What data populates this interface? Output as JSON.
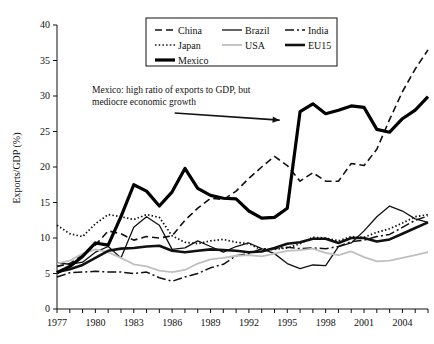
{
  "chart_data": {
    "type": "line",
    "title": "",
    "xlabel": "",
    "ylabel": "Exports/GDP (%)",
    "xlim": [
      1977,
      2006
    ],
    "ylim": [
      0,
      40
    ],
    "ytick_step": 5,
    "yticks": [
      0,
      5,
      10,
      15,
      20,
      25,
      30,
      35,
      40
    ],
    "ytick_labels": [
      "0",
      "5",
      "10",
      "15",
      "20",
      "25",
      "30",
      "35",
      "40"
    ],
    "xticks": [
      1977,
      1978,
      1979,
      1980,
      1981,
      1982,
      1983,
      1984,
      1985,
      1986,
      1987,
      1988,
      1989,
      1990,
      1991,
      1992,
      1993,
      1994,
      1995,
      1996,
      1997,
      1998,
      1999,
      2000,
      2001,
      2002,
      2003,
      2004,
      2005,
      2006
    ],
    "xtick_labels_shown": [
      "1977",
      "1980",
      "1983",
      "1986",
      "1989",
      "1992",
      "1995",
      "1998",
      "2001",
      "2004"
    ],
    "xtick_label_years": [
      1977,
      1980,
      1983,
      1986,
      1989,
      1992,
      1995,
      1998,
      2001,
      2004
    ],
    "grid": false,
    "legend_position": "top-center",
    "x": [
      1977,
      1978,
      1979,
      1980,
      1981,
      1982,
      1983,
      1984,
      1985,
      1986,
      1987,
      1988,
      1989,
      1990,
      1991,
      1992,
      1993,
      1994,
      1995,
      1996,
      1997,
      1998,
      1999,
      2000,
      2001,
      2002,
      2003,
      2004,
      2005,
      2006
    ],
    "series": [
      {
        "name": "China",
        "style": "dashed",
        "color": "#111111",
        "width": 1.6,
        "dash": "7,4",
        "values": [
          6.0,
          6.4,
          7.6,
          9.0,
          11.0,
          10.6,
          9.7,
          10.2,
          10.0,
          10.3,
          12.5,
          14.2,
          15.6,
          15.4,
          16.6,
          18.4,
          20.0,
          21.5,
          20.2,
          18.0,
          19.2,
          18.0,
          18.0,
          20.5,
          20.2,
          22.5,
          26.7,
          30.6,
          33.8,
          36.5
        ]
      },
      {
        "name": "Brazil",
        "style": "solid",
        "color": "#111111",
        "width": 1.3,
        "dash": "none",
        "values": [
          6.5,
          6.3,
          6.6,
          8.0,
          8.8,
          7.2,
          11.5,
          13.0,
          11.8,
          8.4,
          8.6,
          9.6,
          8.8,
          8.0,
          8.8,
          9.3,
          8.5,
          7.8,
          6.4,
          5.7,
          6.2,
          6.1,
          8.8,
          9.3,
          11.0,
          13.0,
          14.5,
          13.8,
          12.7,
          12.2
        ]
      },
      {
        "name": "India",
        "style": "dash-dot",
        "color": "#111111",
        "width": 1.5,
        "dash": "9,3,2,3",
        "values": [
          4.5,
          5.1,
          5.2,
          5.3,
          5.2,
          5.2,
          5.0,
          5.2,
          4.4,
          3.9,
          4.5,
          5.0,
          5.8,
          6.3,
          7.5,
          7.8,
          8.5,
          8.5,
          8.7,
          8.5,
          8.6,
          8.5,
          8.8,
          9.5,
          9.7,
          10.2,
          10.5,
          11.5,
          12.5,
          13.1
        ]
      },
      {
        "name": "Japan",
        "style": "dotted",
        "color": "#111111",
        "width": 1.7,
        "dash": "1.5,2.2",
        "values": [
          11.8,
          10.6,
          10.2,
          12.0,
          13.3,
          13.0,
          12.6,
          13.3,
          12.9,
          10.3,
          9.4,
          9.2,
          9.6,
          9.8,
          9.4,
          9.2,
          8.3,
          8.4,
          8.6,
          9.2,
          10.1,
          10.0,
          9.6,
          10.2,
          10.1,
          10.8,
          11.3,
          12.1,
          13.0,
          13.3
        ]
      },
      {
        "name": "USA",
        "style": "solid",
        "color": "#bfbfbf",
        "width": 1.8,
        "dash": "none",
        "values": [
          6.4,
          6.8,
          7.8,
          8.4,
          8.0,
          7.2,
          6.3,
          6.0,
          5.4,
          5.2,
          5.5,
          6.4,
          7.0,
          7.2,
          7.5,
          7.6,
          7.4,
          7.8,
          8.2,
          8.3,
          8.5,
          7.9,
          7.6,
          8.1,
          7.3,
          6.7,
          6.8,
          7.2,
          7.6,
          8.0
        ]
      },
      {
        "name": "EU15",
        "style": "solid",
        "color": "#111111",
        "width": 2.6,
        "dash": "none",
        "values": [
          5.2,
          5.6,
          6.2,
          7.2,
          8.2,
          8.5,
          8.6,
          8.8,
          8.9,
          8.2,
          8.0,
          8.2,
          8.4,
          8.3,
          8.2,
          8.0,
          8.1,
          8.6,
          9.2,
          9.4,
          9.9,
          9.9,
          9.3,
          10.0,
          10.0,
          9.5,
          9.8,
          10.6,
          11.4,
          12.2
        ]
      },
      {
        "name": "Mexico",
        "style": "solid",
        "color": "#000000",
        "width": 3.2,
        "dash": "none",
        "values": [
          5.1,
          6.0,
          7.4,
          9.3,
          9.0,
          13.0,
          17.5,
          16.6,
          14.5,
          16.5,
          19.8,
          17.0,
          16.0,
          15.6,
          15.5,
          13.8,
          12.8,
          12.9,
          14.2,
          27.8,
          28.9,
          27.5,
          28.0,
          28.6,
          28.4,
          25.3,
          24.9,
          26.8,
          28.0,
          29.9
        ]
      }
    ],
    "annotations": [
      {
        "name": "mexico-callout",
        "line1": "Mexico: high ratio of exports to GDP, but",
        "line2": "mediocre economic growth",
        "arrow_from": [
          1986.2,
          27.6
        ],
        "arrow_to": [
          1994.4,
          26.6
        ]
      }
    ]
  },
  "legend": {
    "entries": [
      {
        "label": "China"
      },
      {
        "label": "Brazil"
      },
      {
        "label": "India"
      },
      {
        "label": "Japan"
      },
      {
        "label": "USA"
      },
      {
        "label": "EU15"
      },
      {
        "label": "Mexico"
      }
    ]
  }
}
